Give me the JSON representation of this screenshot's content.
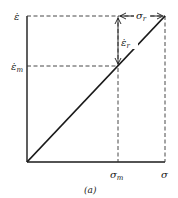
{
  "diagram": {
    "type": "strain-rate vs stress schematic",
    "caption": "(a)",
    "y_axis": {
      "top_label": "ε̇",
      "mid_label_base": "ε̇",
      "mid_label_sub": "m"
    },
    "x_axis": {
      "mid_label_base": "σ",
      "mid_label_sub": "m",
      "end_label": "σ"
    },
    "annotations": {
      "vertical_arrow_base": "ε̇",
      "vertical_arrow_sub": "r",
      "horizontal_arrow_base": "σ",
      "horizontal_arrow_sub": "r"
    },
    "colors": {
      "line": "#1a1a1a",
      "dashed": "#333333",
      "background": "#ffffff"
    }
  }
}
